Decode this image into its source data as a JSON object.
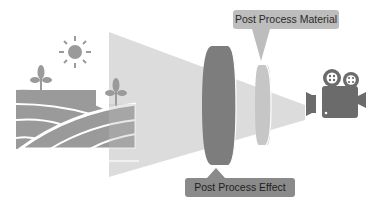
{
  "labels": {
    "post_process_material": "Post Process Material",
    "post_process_effect": "Post Process Effect"
  },
  "colors": {
    "landscape": "#9a9a9a",
    "frustum": "#d9d9d9",
    "effect_lens": "#7a7a7a",
    "material_lens": "#c4c4c4",
    "camera": "#6b6b6b",
    "material_label_bg": "#bdbdbd",
    "effect_label_bg": "#8a8a8a"
  },
  "icons": [
    "sun-icon",
    "plant-icon",
    "field-icon",
    "movie-camera-icon"
  ]
}
